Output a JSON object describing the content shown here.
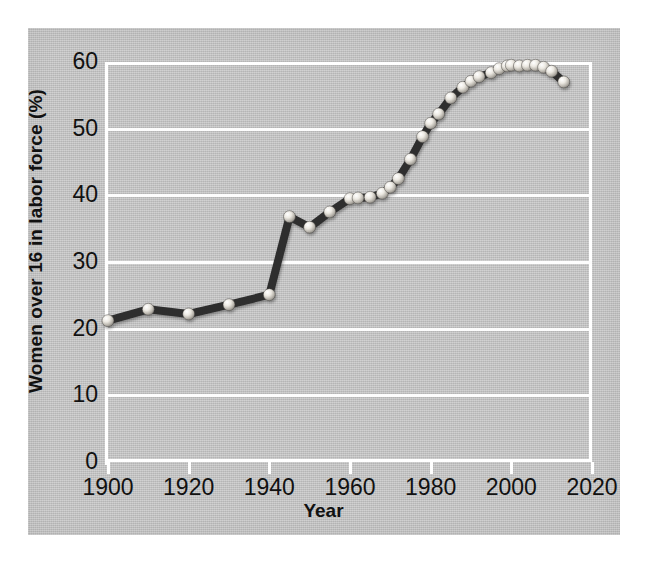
{
  "chart_data": {
    "type": "line",
    "title": "",
    "xlabel": "Year",
    "ylabel": "Women over 16 in labor force (%)",
    "xlim": [
      1900,
      2020
    ],
    "ylim": [
      0,
      60
    ],
    "grid": true,
    "legend": null,
    "xticks": [
      1900,
      1920,
      1940,
      1960,
      1980,
      2000,
      2020
    ],
    "yticks": [
      0,
      10,
      20,
      30,
      40,
      50,
      60
    ],
    "x": [
      1900,
      1910,
      1920,
      1930,
      1940,
      1945,
      1950,
      1955,
      1960,
      1962,
      1965,
      1968,
      1970,
      1972,
      1975,
      1978,
      1980,
      1982,
      1985,
      1988,
      1990,
      1992,
      1995,
      1997,
      1999,
      2000,
      2002,
      2004,
      2006,
      2008,
      2010,
      2013
    ],
    "values": [
      21.2,
      22.9,
      22.2,
      23.6,
      25.1,
      36.8,
      35.2,
      37.5,
      39.5,
      39.6,
      39.7,
      40.3,
      41.2,
      42.5,
      45.4,
      48.8,
      50.8,
      52.2,
      54.6,
      56.2,
      57.1,
      57.8,
      58.4,
      59.0,
      59.4,
      59.5,
      59.4,
      59.5,
      59.5,
      59.2,
      58.6,
      57.0
    ],
    "point_marker": "sphere",
    "line_color": "#2e2e2e",
    "marker_color": "#e8e6e0",
    "grid_color": "#fdfdfd",
    "panel_color": "#c3c3c3"
  },
  "axes": {
    "y_title": "Women over 16 in labor force (%)",
    "x_title": "Year",
    "y_tick_labels": [
      "60",
      "50",
      "40",
      "30",
      "20",
      "10",
      "0"
    ],
    "x_tick_labels": [
      "1900",
      "1920",
      "1940",
      "1960",
      "1980",
      "2000",
      "2020"
    ]
  }
}
